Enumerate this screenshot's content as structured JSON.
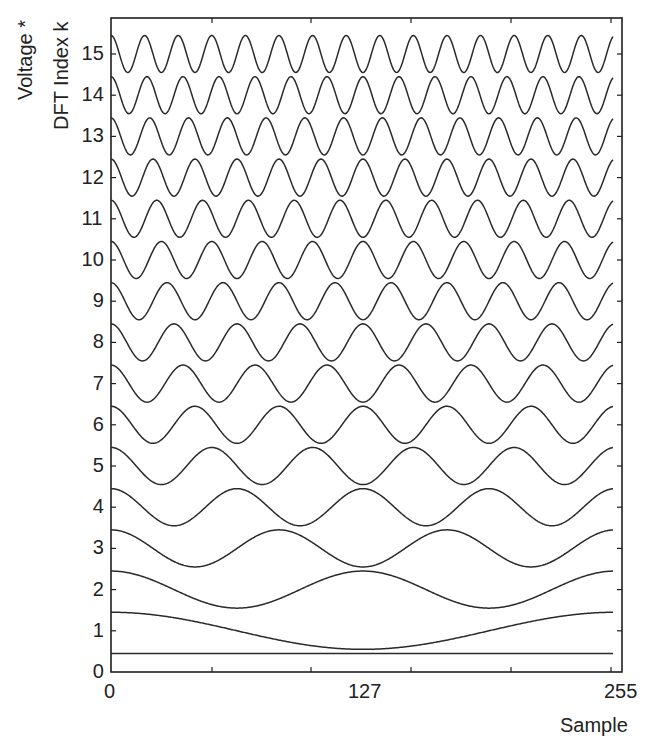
{
  "chart_data": {
    "type": "line",
    "title": "",
    "ylabel_lines": [
      "Voltage *",
      "DFT Index k"
    ],
    "xlabel": "Sample",
    "xlim": [
      0,
      255
    ],
    "ylim": [
      0,
      15.9
    ],
    "x_ticks": [
      0,
      127,
      255
    ],
    "x_tick_labels": [
      "0",
      "127",
      "255"
    ],
    "y_ticks": [
      0,
      1,
      2,
      3,
      4,
      5,
      6,
      7,
      8,
      9,
      10,
      11,
      12,
      13,
      14,
      15
    ],
    "y_tick_labels": [
      "0",
      "1",
      "2",
      "3",
      "4",
      "5",
      "6",
      "7",
      "8",
      "9",
      "10",
      "11",
      "12",
      "13",
      "14",
      "15"
    ],
    "grid": false,
    "legend": "none",
    "N": 256,
    "amplitude": 0.45,
    "series": [
      {
        "name": "k=0",
        "k": 0,
        "offset": 0
      },
      {
        "name": "k=1",
        "k": 1,
        "offset": 1
      },
      {
        "name": "k=2",
        "k": 2,
        "offset": 2
      },
      {
        "name": "k=3",
        "k": 3,
        "offset": 3
      },
      {
        "name": "k=4",
        "k": 4,
        "offset": 4
      },
      {
        "name": "k=5",
        "k": 5,
        "offset": 5
      },
      {
        "name": "k=6",
        "k": 6,
        "offset": 6
      },
      {
        "name": "k=7",
        "k": 7,
        "offset": 7
      },
      {
        "name": "k=8",
        "k": 8,
        "offset": 8
      },
      {
        "name": "k=9",
        "k": 9,
        "offset": 9
      },
      {
        "name": "k=10",
        "k": 10,
        "offset": 10
      },
      {
        "name": "k=11",
        "k": 11,
        "offset": 11
      },
      {
        "name": "k=12",
        "k": 12,
        "offset": 12
      },
      {
        "name": "k=13",
        "k": 13,
        "offset": 13
      },
      {
        "name": "k=14",
        "k": 14,
        "offset": 14
      },
      {
        "name": "k=15",
        "k": 15,
        "offset": 15
      }
    ],
    "colors": {
      "line": "#2a2a2a",
      "axis": "#1e1e1e"
    }
  },
  "labels": {
    "ylabel_line1": "Voltage *",
    "ylabel_line2": "DFT Index k",
    "xlabel": "Sample",
    "x_tick_0": "0",
    "x_tick_127": "127",
    "x_tick_255": "255"
  }
}
